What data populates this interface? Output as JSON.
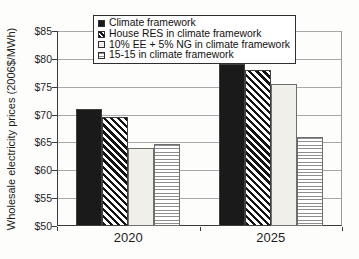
{
  "chart_data": {
    "type": "bar",
    "title": "",
    "xlabel": "",
    "ylabel": "Wholesale electricity prices (2006$/MWh)",
    "categories": [
      "2020",
      "2025"
    ],
    "series": [
      {
        "name": "Climate framework",
        "pattern": "solid-black",
        "values": [
          71.0,
          79.0
        ]
      },
      {
        "name": "House RES in climate framework",
        "pattern": "diagonal-hatch",
        "values": [
          69.5,
          78.0
        ]
      },
      {
        "name": "10% EE + 5% NG in climate framework",
        "pattern": "light-gray",
        "values": [
          64.0,
          75.4
        ]
      },
      {
        "name": "15-15 in climate framework",
        "pattern": "horizontal-lines",
        "values": [
          64.7,
          66.0
        ]
      }
    ],
    "ylim": [
      50,
      85
    ],
    "ytick_step": 5,
    "ytick_labels": [
      "$50",
      "$55",
      "$60",
      "$65",
      "$70",
      "$75",
      "$80",
      "$85"
    ],
    "grid": "horizontal",
    "legend_position": "top-center-inside",
    "colors": {
      "solid_fill": "#1a1a1a",
      "hatch_stroke": "#141414",
      "light_fill": "#f0efe9",
      "stripe_stroke": "#8d8d8d",
      "gridline": "#a8a8a8",
      "axis": "#3a3a3a"
    }
  }
}
